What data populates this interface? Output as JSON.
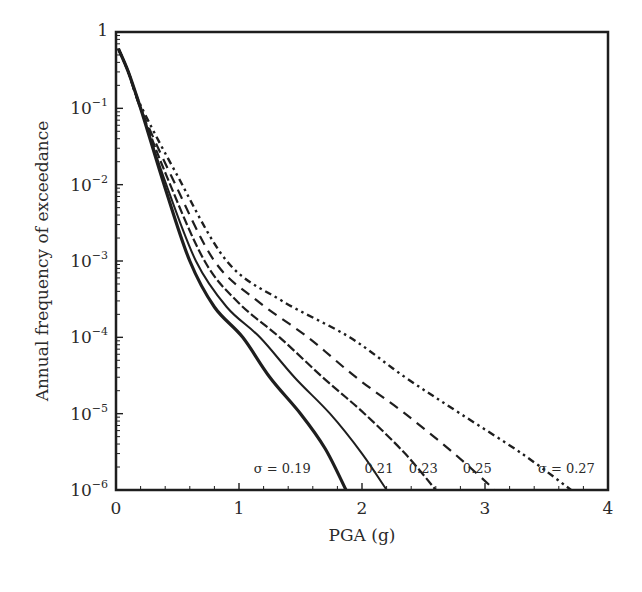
{
  "chart_data": {
    "type": "line",
    "title": "",
    "xlabel": "PGA (g)",
    "ylabel": "Annual frequency of exceedance",
    "xscale": "linear",
    "yscale": "log",
    "xlim": [
      0,
      4
    ],
    "ylim": [
      1e-06,
      1
    ],
    "grid": false,
    "legend_position": "none (inline annotations near curve ends)",
    "x_ticks": [
      0,
      1,
      2,
      3,
      4
    ],
    "x_tick_labels": [
      "0",
      "1",
      "2",
      "3",
      "4"
    ],
    "y_ticks": [
      1e-06,
      1e-05,
      0.0001,
      0.001,
      0.01,
      0.1,
      1
    ],
    "y_tick_labels": [
      {
        "base": "10",
        "exp": "−6"
      },
      {
        "base": "10",
        "exp": "−5"
      },
      {
        "base": "10",
        "exp": "−4"
      },
      {
        "base": "10",
        "exp": "−3"
      },
      {
        "base": "10",
        "exp": "−2"
      },
      {
        "base": "10",
        "exp": "−1"
      },
      {
        "base": "1",
        "exp": ""
      }
    ],
    "series": [
      {
        "name": "σ = 0.19",
        "label": "σ = 0.19",
        "style": "thick-solid",
        "x": [
          0.02,
          0.1,
          0.2,
          0.4,
          0.6,
          0.8,
          1.03,
          1.25,
          1.5,
          1.7,
          1.87
        ],
        "y": [
          0.6,
          0.3,
          0.1,
          0.009,
          0.001,
          0.00025,
          0.0001,
          3e-05,
          1e-05,
          3.5e-06,
          1e-06
        ]
      },
      {
        "name": "σ = 0.21",
        "label": "0.21",
        "style": "thin-solid",
        "x": [
          0.02,
          0.1,
          0.2,
          0.4,
          0.65,
          0.9,
          1.17,
          1.45,
          1.74,
          2.0,
          2.2
        ],
        "y": [
          0.6,
          0.3,
          0.1,
          0.011,
          0.001,
          0.00025,
          0.0001,
          3e-05,
          1e-05,
          3e-06,
          1e-06
        ]
      },
      {
        "name": "σ = 0.23",
        "label": "0.23",
        "style": "long-dash",
        "x": [
          0.02,
          0.1,
          0.2,
          0.42,
          0.72,
          1.0,
          1.33,
          1.68,
          2.02,
          2.35,
          2.6
        ],
        "y": [
          0.6,
          0.3,
          0.1,
          0.012,
          0.001,
          0.00028,
          0.0001,
          3e-05,
          1e-05,
          3e-06,
          1e-06
        ]
      },
      {
        "name": "σ = 0.25",
        "label": "0.25",
        "style": "dashed",
        "x": [
          0.02,
          0.1,
          0.2,
          0.45,
          0.8,
          1.15,
          1.56,
          1.95,
          2.35,
          2.75,
          3.08
        ],
        "y": [
          0.6,
          0.3,
          0.1,
          0.013,
          0.001,
          0.0003,
          0.0001,
          3e-05,
          1e-05,
          3e-06,
          1e-06
        ]
      },
      {
        "name": "σ = 0.27",
        "label": "σ = 0.27",
        "style": "dash-dot-dot",
        "x": [
          0.02,
          0.1,
          0.2,
          0.48,
          0.9,
          1.35,
          1.9,
          2.35,
          2.8,
          3.3,
          3.7
        ],
        "y": [
          0.6,
          0.3,
          0.11,
          0.015,
          0.001,
          0.0003,
          0.0001,
          3e-05,
          1e-05,
          3e-06,
          1e-06
        ]
      }
    ],
    "annotations": [
      {
        "text": "σ = 0.19",
        "x": 1.12,
        "y": 1.9e-06
      },
      {
        "text": "0.21",
        "x": 2.02,
        "y": 1.9e-06
      },
      {
        "text": "0.23",
        "x": 2.38,
        "y": 1.9e-06
      },
      {
        "text": "0.25",
        "x": 2.82,
        "y": 1.9e-06
      },
      {
        "text": "σ = 0.27",
        "x": 3.43,
        "y": 1.9e-06
      }
    ]
  },
  "colors": {
    "line": "#1e1e1e",
    "axis": "#1e1e1e",
    "text": "#2a2a2a",
    "background": "#ffffff"
  }
}
